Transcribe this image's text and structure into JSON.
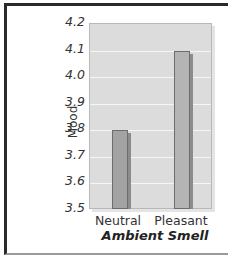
{
  "chart_data": {
    "type": "bar",
    "title": "",
    "categories": [
      "Neutral",
      "Pleasant"
    ],
    "values": [
      3.8,
      4.1
    ],
    "xlabel": "Ambient Smell",
    "ylabel": "Mood",
    "ylim": [
      3.5,
      4.2
    ],
    "yticks": [
      "4.2",
      "4.1",
      "4.0",
      "3.9",
      "3.8",
      "3.7",
      "3.6",
      "3.5"
    ],
    "grid": true,
    "legend": null,
    "colors": {
      "neutral": "#a3a3a3",
      "pleasant": "#b4b4b4",
      "plot_bg": "#dcdcdc",
      "gridline": "#f6f6f6"
    }
  }
}
